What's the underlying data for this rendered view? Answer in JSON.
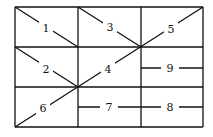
{
  "diagram": {
    "type": "grid-with-numbered-segments",
    "grid": {
      "columns": 3,
      "rows": 3,
      "x": [
        15,
        78,
        141,
        203
      ],
      "y": [
        7,
        47,
        87,
        127
      ]
    },
    "colors": {
      "line": "#111111",
      "background": "#ffffff"
    },
    "labels": [
      {
        "id": "1",
        "text": "1",
        "x": 46,
        "y": 28
      },
      {
        "id": "2",
        "text": "2",
        "x": 46,
        "y": 69
      },
      {
        "id": "3",
        "text": "3",
        "x": 110,
        "y": 27
      },
      {
        "id": "4",
        "text": "4",
        "x": 108,
        "y": 69
      },
      {
        "id": "5",
        "text": "5",
        "x": 171,
        "y": 29
      },
      {
        "id": "6",
        "text": "6",
        "x": 43,
        "y": 108
      },
      {
        "id": "7",
        "text": "7",
        "x": 109,
        "y": 107
      },
      {
        "id": "8",
        "text": "8",
        "x": 170,
        "y": 107
      },
      {
        "id": "9",
        "text": "9",
        "x": 170,
        "y": 68
      }
    ]
  }
}
